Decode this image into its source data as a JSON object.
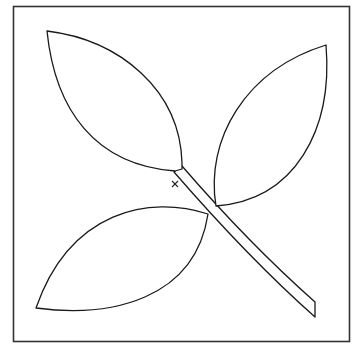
{
  "figure": {
    "colors": {
      "stroke": "#1a1a1a",
      "frame": "#333333",
      "background": "#ffffff"
    },
    "elements": [
      {
        "name": "frame",
        "type": "rectangle"
      },
      {
        "name": "leaf-top-left",
        "type": "leaf"
      },
      {
        "name": "leaf-right",
        "type": "leaf"
      },
      {
        "name": "leaf-bottom-left",
        "type": "leaf"
      },
      {
        "name": "stem",
        "type": "stem"
      },
      {
        "name": "cross-marker",
        "type": "marker",
        "glyph": "×"
      }
    ]
  }
}
